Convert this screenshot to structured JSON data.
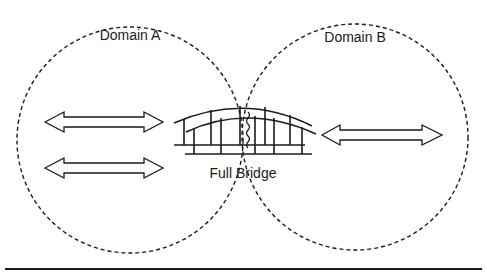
{
  "diagram": {
    "domains": [
      {
        "label": "Domain A"
      },
      {
        "label": "Domain B"
      }
    ],
    "bridge": {
      "label": "Full Bridge"
    },
    "arrows": [
      {
        "name": "domain-a-arrow-top"
      },
      {
        "name": "domain-a-arrow-bottom"
      },
      {
        "name": "domain-b-arrow"
      }
    ],
    "colors": {
      "stroke": "#1a1a1a",
      "background": "#ffffff"
    }
  }
}
